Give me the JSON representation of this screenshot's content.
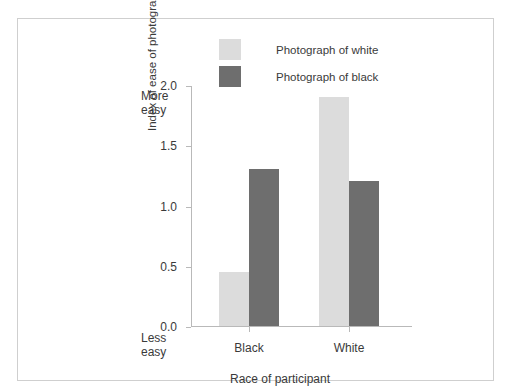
{
  "chart_data": {
    "type": "bar",
    "title": "",
    "xlabel": "Race of participant",
    "ylabel": "Index of ease of photograph recognition",
    "categories": [
      "Black",
      "White"
    ],
    "series": [
      {
        "name": "Photograph of white",
        "color": "#dcdcdc",
        "values": [
          0.45,
          1.9
        ]
      },
      {
        "name": "Photograph of black",
        "color": "#6e6e6e",
        "values": [
          1.3,
          1.2
        ]
      }
    ],
    "ylim": [
      0.0,
      2.0
    ],
    "yticks": [
      "0.0",
      "0.5",
      "1.0",
      "1.5",
      "2.0"
    ],
    "ytick_values": [
      0.0,
      0.5,
      1.0,
      1.5,
      2.0
    ],
    "grid": false,
    "legend_position": "top-center",
    "annotations": {
      "axis_high": "More\neasy",
      "axis_high_line1": "More",
      "axis_high_line2": "easy",
      "axis_low_line1": "Less",
      "axis_low_line2": "easy"
    }
  },
  "legend": {
    "items": [
      {
        "label": "Photograph of white",
        "color": "#dcdcdc"
      },
      {
        "label": "Photograph of black",
        "color": "#6e6e6e"
      }
    ]
  },
  "axes": {
    "y_title": "Index of ease of photograph recognition",
    "x_title": "Race of participant",
    "y_ticks": [
      "2.0",
      "1.5",
      "1.0",
      "0.5",
      "0.0"
    ],
    "x_ticks": [
      "Black",
      "White"
    ],
    "more_easy_1": "More",
    "more_easy_2": "easy",
    "less_easy_1": "Less",
    "less_easy_2": "easy"
  },
  "colors": {
    "bar_light": "#dcdcdc",
    "bar_dark": "#6e6e6e",
    "axis": "#b9b9b9",
    "frame": "#cfcfcf",
    "text": "#3a3a3a"
  }
}
